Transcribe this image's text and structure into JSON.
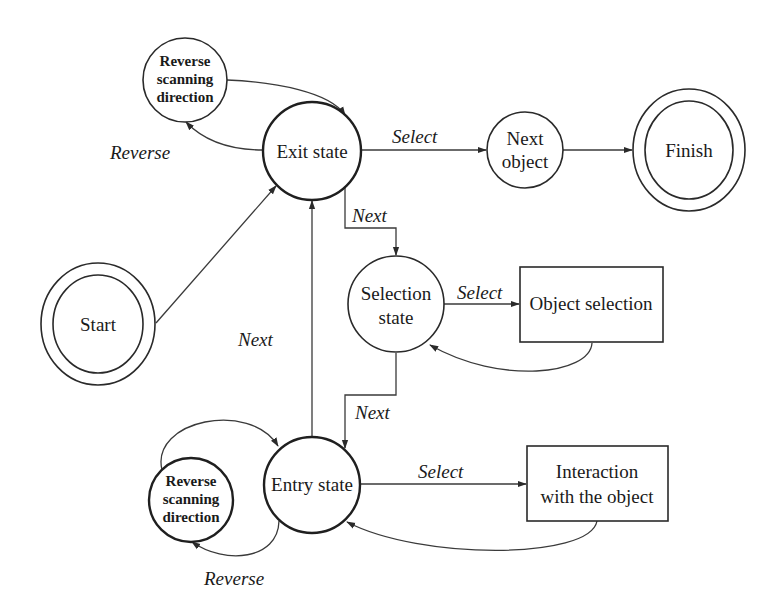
{
  "diagram": {
    "type": "state-machine",
    "nodes": {
      "start": {
        "label": "Start",
        "shape": "double-circle"
      },
      "exit_state": {
        "label": "Exit state",
        "shape": "circle"
      },
      "next_object": {
        "label_line1": "Next",
        "label_line2": "object",
        "shape": "circle"
      },
      "finish": {
        "label": "Finish",
        "shape": "double-circle"
      },
      "reverse_top": {
        "label_line1": "Reverse",
        "label_line2": "scanning",
        "label_line3": "direction",
        "shape": "circle"
      },
      "selection_state": {
        "label_line1": "Selection",
        "label_line2": "state",
        "shape": "circle"
      },
      "object_selection": {
        "label": "Object selection",
        "shape": "rectangle"
      },
      "entry_state": {
        "label": "Entry state",
        "shape": "circle"
      },
      "reverse_bottom": {
        "label_line1": "Reverse",
        "label_line2": "scanning",
        "label_line3": "direction",
        "shape": "circle"
      },
      "interaction": {
        "label_line1": "Interaction",
        "label_line2": "with the object",
        "shape": "rectangle"
      }
    },
    "edges": {
      "start_to_exit": {
        "from": "Start",
        "to": "Exit state",
        "label": ""
      },
      "exit_to_reverse": {
        "from": "Exit state",
        "to": "Reverse scanning direction",
        "label": "Reverse"
      },
      "reverse_to_exit": {
        "from": "Reverse scanning direction",
        "to": "Exit state",
        "label": ""
      },
      "exit_to_next_object": {
        "from": "Exit state",
        "to": "Next object",
        "label": "Select"
      },
      "next_object_to_finish": {
        "from": "Next object",
        "to": "Finish",
        "label": ""
      },
      "exit_to_selection": {
        "from": "Exit state",
        "to": "Selection state",
        "label": "Next"
      },
      "selection_to_object_selection": {
        "from": "Selection state",
        "to": "Object selection",
        "label": "Select"
      },
      "object_selection_to_selection": {
        "from": "Object selection",
        "to": "Selection state",
        "label": ""
      },
      "selection_to_entry": {
        "from": "Selection state",
        "to": "Entry state",
        "label": "Next"
      },
      "entry_to_exit": {
        "from": "Entry state",
        "to": "Exit state",
        "label": "Next"
      },
      "entry_to_interaction": {
        "from": "Entry state",
        "to": "Interaction with the object",
        "label": "Select"
      },
      "interaction_to_entry": {
        "from": "Interaction with the object",
        "to": "Entry state",
        "label": ""
      },
      "entry_to_reverse": {
        "from": "Entry state",
        "to": "Reverse scanning direction",
        "label": "Reverse"
      },
      "reverse_to_entry": {
        "from": "Reverse scanning direction",
        "to": "Entry state",
        "label": ""
      }
    }
  }
}
